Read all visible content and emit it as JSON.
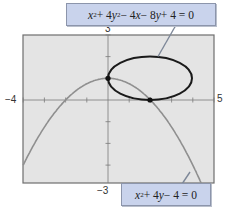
{
  "chart_data": {
    "type": "line",
    "title": "",
    "xlabel": "",
    "ylabel": "",
    "xlim": [
      -4,
      5
    ],
    "ylim": [
      -3,
      3
    ],
    "tick_labels": {
      "x_min": "−4",
      "x_max": "5",
      "y_max": "3",
      "y_min": "−3"
    },
    "grid": false,
    "background": "#e4e4e4",
    "series": [
      {
        "name": "ellipse",
        "equation": "x^2 + 4y^2 - 4x - 8y + 4 = 0",
        "shape": "ellipse",
        "center": [
          2,
          1
        ],
        "semi_axes": [
          2,
          1
        ],
        "color": "#1a1a1a"
      },
      {
        "name": "parabola",
        "equation": "x^2 + 4y - 4 = 0",
        "shape": "parabola",
        "function": "y = 1 - x^2/4",
        "color": "#8f8f8f"
      }
    ],
    "intersection_points": [
      [
        0,
        1
      ],
      [
        2,
        0
      ]
    ],
    "annotations": [
      {
        "text": "x² + 4y² − 4x − 8y + 4 = 0",
        "points_to": "ellipse",
        "position": "top"
      },
      {
        "text": "x² + 4y − 4 = 0",
        "points_to": "parabola",
        "position": "bottom-right"
      }
    ]
  },
  "labels": {
    "x_min": "−4",
    "x_max": "5",
    "y_max": "3",
    "y_min": "−3",
    "eq1": {
      "t1": "x",
      "s1": "2",
      "t2": " + 4",
      "t3": "y",
      "s2": "2",
      "t4": " − 4",
      "t5": "x",
      "t6": " − 8",
      "t7": "y",
      "t8": " + 4 = 0"
    },
    "eq2": {
      "t1": "x",
      "s1": "2",
      "t2": " + 4",
      "t3": "y",
      "t4": " − 4 = 0"
    }
  }
}
